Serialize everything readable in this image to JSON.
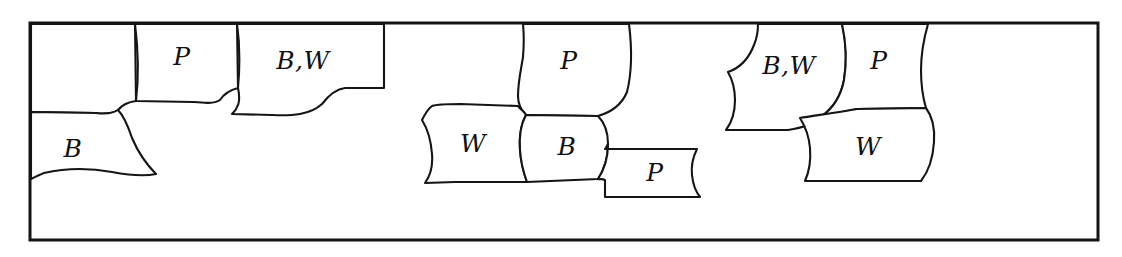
{
  "figure": {
    "kind": "hand-drawn-diagram",
    "title": "",
    "background_color": "#ffffff",
    "ink_color": "#151515",
    "frame": {
      "label": "outer-rectangle",
      "x": 29,
      "y": 22,
      "width": 1070,
      "height": 219
    },
    "clusters": [
      {
        "name": "cluster-left",
        "cells": [
          {
            "id": "L1",
            "label": "",
            "cx": 80,
            "cy": 62
          },
          {
            "id": "L2",
            "label": "P",
            "cx": 182,
            "cy": 58
          },
          {
            "id": "L3",
            "label": "B,W",
            "cx": 303,
            "cy": 62
          },
          {
            "id": "L4",
            "label": "B",
            "cx": 73,
            "cy": 150
          }
        ]
      },
      {
        "name": "cluster-middle",
        "cells": [
          {
            "id": "M1",
            "label": "P",
            "cx": 569,
            "cy": 62
          },
          {
            "id": "M2",
            "label": "W",
            "cx": 473,
            "cy": 145
          },
          {
            "id": "M3",
            "label": "B",
            "cx": 567,
            "cy": 148
          },
          {
            "id": "M4",
            "label": "P",
            "cx": 655,
            "cy": 174
          }
        ]
      },
      {
        "name": "cluster-right",
        "cells": [
          {
            "id": "R1",
            "label": "B,W",
            "cx": 789,
            "cy": 67
          },
          {
            "id": "R2",
            "label": "P",
            "cx": 879,
            "cy": 62
          },
          {
            "id": "R3",
            "label": "W",
            "cx": 868,
            "cy": 148
          }
        ]
      }
    ],
    "legend_letters": [
      "P",
      "B",
      "W",
      "B,W"
    ]
  }
}
